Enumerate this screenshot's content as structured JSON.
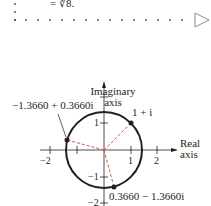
{
  "text_fragment": {
    "equation_tail": "= ∜8."
  },
  "figure": {
    "y_axis_label_line1": "Imaginary",
    "y_axis_label_line2": "axis",
    "x_axis_label_line1": "Real",
    "x_axis_label_line2": "axis",
    "x_ticks": [
      "−2",
      "1",
      "2"
    ],
    "y_ticks": [
      "1",
      "−1",
      "−2"
    ],
    "points": [
      {
        "label": "1 + i",
        "re": 1,
        "im": 1
      },
      {
        "label": "−1.3660 + 0.3660i",
        "re": -1.366,
        "im": 0.366
      },
      {
        "label": "0.3660 − 1.3660i",
        "re": 0.366,
        "im": -1.366
      }
    ],
    "circle_radius": "√2",
    "colors": {
      "ink": "#231f20",
      "dashed_rays": "#d9534f"
    }
  }
}
